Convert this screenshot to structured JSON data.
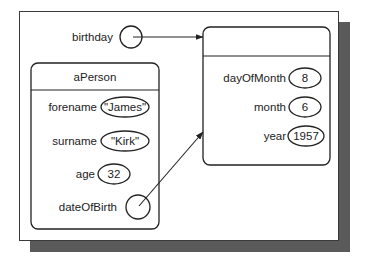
{
  "diagram": {
    "type": "object-reference-diagram",
    "colors": {
      "frame": "#3a3a3a",
      "shadow": "#5a5a5a",
      "ink": "#222222",
      "background": "#ffffff"
    },
    "reference_variable": {
      "label": "birthday",
      "points_to": "date_object"
    },
    "person_object": {
      "title": "aPerson",
      "attributes": [
        {
          "name": "forename",
          "value": "\"James\""
        },
        {
          "name": "surname",
          "value": "\"Kirk\""
        },
        {
          "name": "age",
          "value": "32"
        },
        {
          "name": "dateOfBirth",
          "value": "",
          "is_reference": true,
          "points_to": "date_object"
        }
      ]
    },
    "date_object": {
      "title": "",
      "attributes": [
        {
          "name": "dayOfMonth",
          "value": "8"
        },
        {
          "name": "month",
          "value": "6"
        },
        {
          "name": "year",
          "value": "1957"
        }
      ]
    }
  }
}
